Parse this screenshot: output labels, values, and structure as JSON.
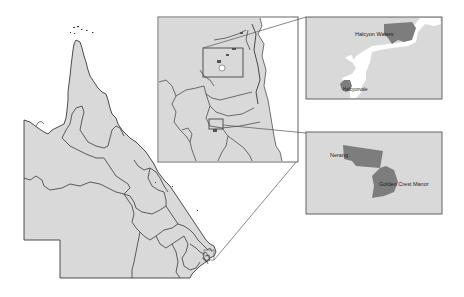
{
  "figure": {
    "type": "locator-map",
    "region": "Queensland",
    "colors": {
      "land": "#d9d9d9",
      "border": "#3a3a3a",
      "water": "#ffffff",
      "highlight": "#7d7d7d",
      "frame": "#555555"
    }
  },
  "insets": {
    "regional": {
      "label": "South-east coast detail"
    },
    "top": {
      "labels": [
        {
          "text": "Halcyon Waters"
        },
        {
          "text": "Halcyonvale"
        }
      ]
    },
    "bottom": {
      "labels": [
        {
          "text": "Nerang"
        },
        {
          "text": "Golden Crest Manor"
        }
      ]
    }
  }
}
